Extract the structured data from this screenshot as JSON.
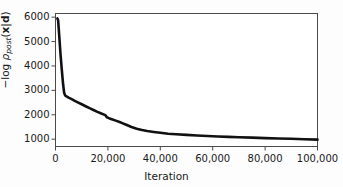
{
  "chart_data": {
    "type": "line",
    "title": "",
    "xlabel": "Iteration",
    "ylabel": "-log ρ_post(x|d)",
    "ylabel_parts": {
      "minus": "−",
      "log": "log",
      "rho": "ρ",
      "subscript": "post",
      "open_paren": "(",
      "x": "x",
      "bar": "|",
      "d": "d",
      "close_paren": ")"
    },
    "xlim": [
      0,
      100000
    ],
    "ylim": [
      700,
      6150
    ],
    "grid": false,
    "legend": null,
    "xticks": [
      0,
      20000,
      40000,
      60000,
      80000,
      100000
    ],
    "xticklabels": [
      "0",
      "20,000",
      "40,000",
      "60,000",
      "80,000",
      "100,000"
    ],
    "yticks": [
      1000,
      2000,
      3000,
      4000,
      5000,
      6000
    ],
    "yticklabels": [
      "1000",
      "2000",
      "3000",
      "4000",
      "5000",
      "6000"
    ],
    "line_color": "#111111",
    "line_width": 2.6,
    "series": [
      {
        "name": "negative log posterior",
        "x": [
          700,
          1000,
          1400,
          1900,
          2400,
          2900,
          3300,
          3700,
          4200,
          5000,
          6000,
          7200,
          8500,
          10000,
          11500,
          13000,
          14500,
          16000,
          17500,
          19000,
          19600,
          20400,
          21500,
          23000,
          25000,
          27000,
          29000,
          31000,
          33000,
          35000,
          37500,
          40000,
          43000,
          46000,
          50000,
          54000,
          58000,
          62000,
          66000,
          70000,
          75000,
          80000,
          85000,
          90000,
          95000,
          100000
        ],
        "y": [
          5950,
          5870,
          5280,
          4500,
          3850,
          3250,
          2900,
          2790,
          2750,
          2700,
          2650,
          2580,
          2510,
          2430,
          2350,
          2270,
          2195,
          2120,
          2050,
          1985,
          1900,
          1860,
          1820,
          1760,
          1680,
          1590,
          1500,
          1430,
          1375,
          1335,
          1295,
          1260,
          1225,
          1200,
          1175,
          1150,
          1130,
          1110,
          1095,
          1080,
          1062,
          1045,
          1030,
          1015,
          998,
          980
        ]
      }
    ]
  },
  "axes": {
    "x_axis_name": "iteration-axis",
    "y_axis_name": "negative-log-posterior-axis"
  }
}
